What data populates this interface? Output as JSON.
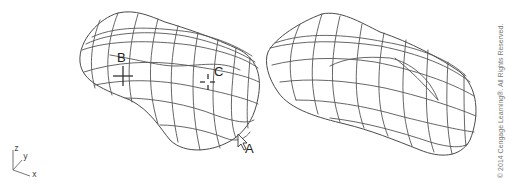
{
  "figure": {
    "left_model": {
      "description": "wireframe surface model with pick points",
      "labels": {
        "point_b": "B",
        "point_c": "C",
        "point_a": "A"
      }
    },
    "right_model": {
      "description": "wireframe surface model"
    },
    "axis_tripod": {
      "z": "z",
      "y": "y",
      "x": "x"
    },
    "copyright": "© 2014 Cengage Learning®. All Rights Reserved."
  }
}
